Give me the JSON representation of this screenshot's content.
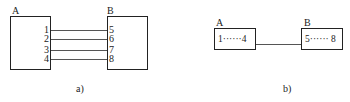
{
  "panel_a": {
    "caption": "a)",
    "box_a": {
      "label": "A",
      "pins": [
        "1",
        "2",
        "3",
        "4"
      ]
    },
    "box_b": {
      "label": "B",
      "pins": [
        "5",
        "6",
        "7",
        "8"
      ]
    },
    "wire_count": 4
  },
  "panel_b": {
    "caption": "b)",
    "box_a": {
      "label": "A",
      "content": "1······4"
    },
    "box_b": {
      "label": "B",
      "content": "5······ 8"
    }
  }
}
